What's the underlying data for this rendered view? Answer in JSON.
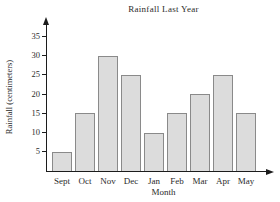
{
  "chart_data": {
    "type": "bar",
    "title": "Rainfall Last Year",
    "xlabel": "Month",
    "ylabel": "Rainfall (centimeters)",
    "categories": [
      "Sept",
      "Oct",
      "Nov",
      "Dec",
      "Jan",
      "Feb",
      "Mar",
      "Apr",
      "May"
    ],
    "values": [
      5,
      15,
      30,
      25,
      10,
      15,
      20,
      25,
      15
    ],
    "yticks": [
      5,
      10,
      15,
      20,
      25,
      30,
      35
    ],
    "ylim": [
      0,
      38
    ],
    "grid": false,
    "legend": "none",
    "colors": {
      "bar_fill": "#dcdcdc",
      "bar_border": "#8a8a8a",
      "axis": "#1c1c1c",
      "text": "#2b2b2b",
      "background": "#ffffff"
    }
  }
}
